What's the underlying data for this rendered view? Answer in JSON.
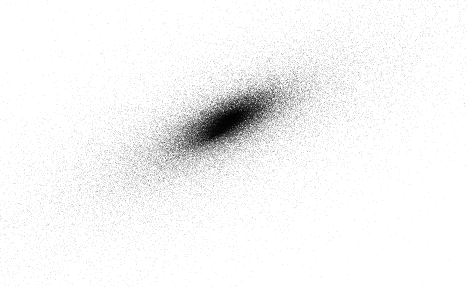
{
  "figure": {
    "title": "",
    "width": 467,
    "height": 287,
    "background_color": "#ffffff",
    "point_color": "#000000",
    "core_color": "#2e2e2e",
    "midtone_color": "#9a9a9a",
    "halo_color": "#d8d8d8"
  },
  "chart_data": {
    "type": "scatter",
    "title": "",
    "subtitle": "",
    "xlabel": "",
    "ylabel": "",
    "xlim": [
      0,
      467
    ],
    "ylim": [
      0,
      287
    ],
    "grid": false,
    "axes_visible": false,
    "ticks_visible": false,
    "legend": null,
    "legend_position": "none",
    "annotations": [],
    "marker": {
      "shape": "square",
      "size_px": 1,
      "alpha": 0.55,
      "color": "#000000"
    },
    "center": {
      "x": 231,
      "y": 116
    },
    "position_angle_deg": -25.0,
    "series": [
      {
        "name": "nucleus",
        "n_points": 9000,
        "profile": "gaussian",
        "scale_major_px": 26,
        "scale_minor_px": 9,
        "center_offset": {
          "x": 0,
          "y": 0
        },
        "alpha": 0.5,
        "color": "#000000"
      },
      {
        "name": "bulge",
        "n_points": 12000,
        "profile": "exponential",
        "scale_major_px": 52,
        "scale_minor_px": 19,
        "center_offset": {
          "x": 0,
          "y": 2
        },
        "alpha": 0.42,
        "color": "#000000"
      },
      {
        "name": "inner-disk",
        "n_points": 21000,
        "profile": "exponential",
        "scale_major_px": 95,
        "scale_minor_px": 30,
        "center_offset": {
          "x": -4,
          "y": 8
        },
        "alpha": 0.34,
        "color": "#000000"
      },
      {
        "name": "outer-disk",
        "n_points": 26000,
        "profile": "exponential",
        "scale_major_px": 150,
        "scale_minor_px": 47,
        "center_offset": {
          "x": -10,
          "y": 14
        },
        "alpha": 0.26,
        "color": "#000000"
      },
      {
        "name": "halo",
        "n_points": 20000,
        "profile": "exponential",
        "scale_major_px": 235,
        "scale_minor_px": 86,
        "center_offset": {
          "x": -18,
          "y": 20
        },
        "alpha": 0.2,
        "color": "#000000"
      }
    ],
    "extent_notes": {
      "major_axis_from": {
        "x": 22,
        "y": 262
      },
      "major_axis_to": {
        "x": 452,
        "y": 26
      },
      "darkest_region": {
        "x": 196,
        "y": 100,
        "width": 72,
        "height": 32
      }
    }
  }
}
